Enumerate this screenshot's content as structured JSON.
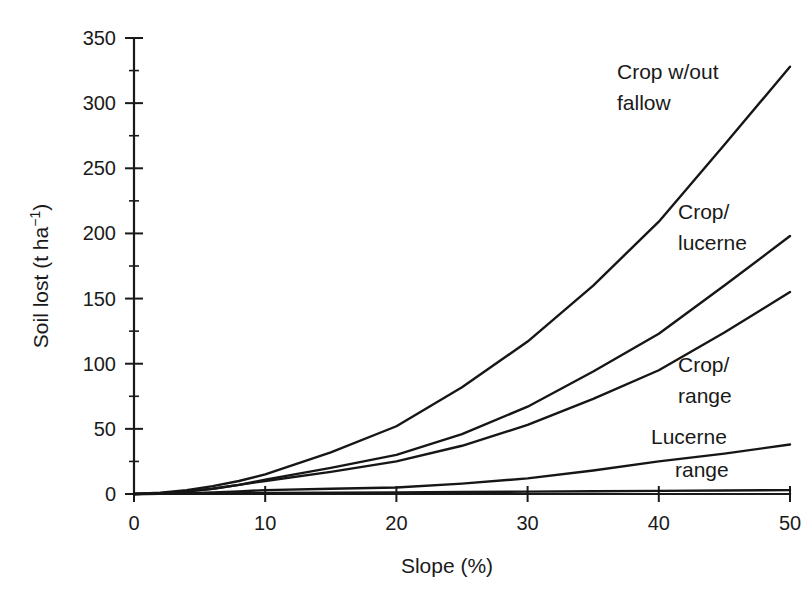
{
  "chart_data": {
    "type": "line",
    "title": "",
    "xlabel": "Slope (%)",
    "ylabel": "Soil lost (t ha−1)",
    "ylabel_base": "Soil lost (t ha",
    "ylabel_exponent": "−1",
    "ylabel_close": ")",
    "xlim": [
      0,
      50
    ],
    "ylim": [
      0,
      350
    ],
    "grid": false,
    "legend_position": "inline-right",
    "x_ticks": [
      0,
      10,
      20,
      30,
      40,
      50
    ],
    "x_tick_labels": [
      "0",
      "10",
      "20",
      "30",
      "40",
      "50"
    ],
    "y_ticks": [
      0,
      50,
      100,
      150,
      200,
      250,
      300,
      350
    ],
    "y_tick_labels": [
      "0",
      "50",
      "100",
      "150",
      "200",
      "250",
      "300",
      "350"
    ],
    "x": [
      0,
      2,
      4,
      6,
      8,
      10,
      15,
      20,
      25,
      30,
      35,
      40,
      45,
      50
    ],
    "series": [
      {
        "name": "Crop w/out fallow",
        "label_line1": "Crop w/out",
        "label_line2": "fallow",
        "values": [
          0,
          1,
          3,
          6,
          10,
          15,
          32,
          52,
          82,
          117,
          160,
          209,
          268,
          328
        ],
        "end_value": 328,
        "color": "#161616"
      },
      {
        "name": "Crop/lucerne",
        "label_line1": "Crop/",
        "label_line2": "lucerne",
        "values": [
          0,
          0.5,
          2,
          4,
          7,
          11,
          20,
          30,
          46,
          67,
          94,
          123,
          160,
          198
        ],
        "end_value": 198,
        "color": "#161616"
      },
      {
        "name": "Crop/range",
        "label_line1": "Crop/",
        "label_line2": "range",
        "values": [
          0,
          0.5,
          2,
          4,
          7,
          10,
          17,
          25,
          37,
          53,
          73,
          95,
          124,
          155
        ],
        "end_value": 155,
        "color": "#161616"
      },
      {
        "name": "Lucerne",
        "label_line1": "Lucerne",
        "label_line2": "",
        "values": [
          0,
          0.2,
          0.6,
          1.2,
          2,
          3,
          4,
          5,
          8,
          12,
          18,
          25,
          31,
          38
        ],
        "end_value": 38,
        "color": "#161616"
      },
      {
        "name": "range",
        "label_line1": "range",
        "label_line2": "",
        "values": [
          0,
          0.1,
          0.2,
          0.4,
          0.6,
          0.8,
          1.0,
          1.2,
          1.5,
          1.8,
          2.1,
          2.4,
          2.7,
          3
        ],
        "end_value": 3,
        "color": "#161616"
      }
    ],
    "annotations": [
      {
        "text": "Crop w/out",
        "x_px": 617,
        "y_px": 79
      },
      {
        "text": "fallow",
        "x_px": 617,
        "y_px": 110
      },
      {
        "text": "Crop/",
        "x_px": 678,
        "y_px": 219
      },
      {
        "text": "lucerne",
        "x_px": 678,
        "y_px": 250
      },
      {
        "text": "Crop/",
        "x_px": 678,
        "y_px": 372
      },
      {
        "text": "range",
        "x_px": 678,
        "y_px": 403
      },
      {
        "text": "Lucerne",
        "x_px": 651,
        "y_px": 444
      },
      {
        "text": "range",
        "x_px": 675,
        "y_px": 477
      }
    ]
  }
}
